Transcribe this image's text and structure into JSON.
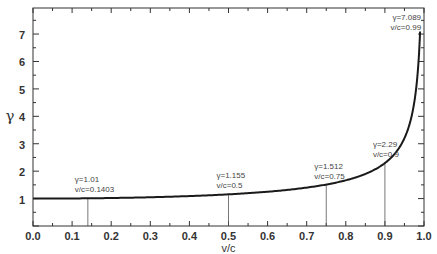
{
  "chart_data": {
    "type": "line",
    "title": "",
    "xlabel": "v/c",
    "ylabel": "γ",
    "xlim": [
      0.0,
      1.0
    ],
    "ylim": [
      0,
      7.95
    ],
    "x_ticks": [
      "0.0",
      "0.1",
      "0.2",
      "0.3",
      "0.4",
      "0.5",
      "0.6",
      "0.7",
      "0.8",
      "0.9",
      "1.0"
    ],
    "y_ticks": [
      "1",
      "2",
      "3",
      "4",
      "5",
      "6",
      "7"
    ],
    "grid": false,
    "series": [
      {
        "name": "Lorentz factor γ = 1/sqrt(1-(v/c)^2)",
        "x": [
          0.0,
          0.1,
          0.1403,
          0.2,
          0.3,
          0.4,
          0.5,
          0.6,
          0.7,
          0.75,
          0.8,
          0.85,
          0.9,
          0.93,
          0.95,
          0.97,
          0.98,
          0.99
        ],
        "y": [
          1.0,
          1.005,
          1.01,
          1.021,
          1.048,
          1.091,
          1.155,
          1.25,
          1.4,
          1.512,
          1.667,
          1.898,
          2.29,
          2.72,
          3.203,
          4.113,
          5.025,
          7.089
        ]
      }
    ],
    "annotations": [
      {
        "x": 0.1403,
        "y": 1.01,
        "line1": "γ=1.01",
        "line2": "v/c=0.1403"
      },
      {
        "x": 0.5,
        "y": 1.155,
        "line1": "γ=1.155",
        "line2": "v/c=0.5"
      },
      {
        "x": 0.75,
        "y": 1.512,
        "line1": "γ=1.512",
        "line2": "v/c=0.75"
      },
      {
        "x": 0.9,
        "y": 2.29,
        "line1": "γ=2.29",
        "line2": "v/c=0.9"
      },
      {
        "x": 0.99,
        "y": 7.089,
        "line1": "γ=7.089",
        "line2": "v/c=0.99"
      }
    ],
    "legend": "none"
  }
}
